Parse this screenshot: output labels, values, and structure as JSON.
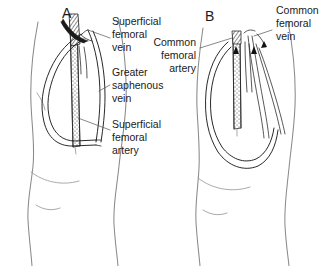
{
  "figure": {
    "background_color": "#ffffff",
    "ink_color": "#1a1a1a",
    "outline_color": "#8a8a8a"
  },
  "panels": [
    {
      "id": "A",
      "letter": "A",
      "letter_x": 62,
      "letter_y": 18
    },
    {
      "id": "B",
      "letter": "B",
      "letter_x": 205,
      "letter_y": 21
    }
  ],
  "labels": [
    {
      "id": "superficial-femoral-vein",
      "lines": [
        "Superficial",
        "femoral",
        "vein"
      ],
      "x": 112,
      "y": 25,
      "align": "start"
    },
    {
      "id": "greater-saphenous-vein",
      "lines": [
        "Greater",
        "saphenous",
        "vein"
      ],
      "x": 112,
      "y": 76,
      "align": "start"
    },
    {
      "id": "superficial-femoral-artery",
      "lines": [
        "Superficial",
        "femoral",
        "artery"
      ],
      "x": 112,
      "y": 128,
      "align": "start"
    },
    {
      "id": "common-femoral-artery",
      "lines": [
        "Common",
        "femoral",
        "artery"
      ],
      "x": 196,
      "y": 46,
      "align": "end"
    },
    {
      "id": "common-femoral-vein",
      "lines": [
        "Common",
        "femoral",
        "vein"
      ],
      "x": 276,
      "y": 14,
      "align": "start"
    }
  ]
}
